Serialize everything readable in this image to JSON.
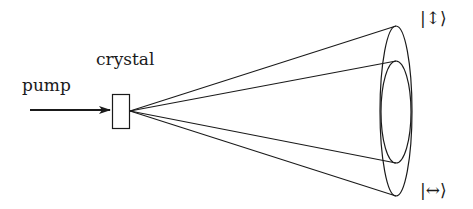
{
  "diagram": {
    "labels": {
      "pump": "pump",
      "crystal": "crystal",
      "state_vertical": "|↕⟩",
      "state_horizontal": "|↔⟩"
    },
    "colors": {
      "stroke": "#1a1a1a",
      "background": "#ffffff"
    },
    "elements": {
      "pump_arrow": {
        "x1": 30,
        "y1": 110,
        "x2": 110,
        "y2": 110
      },
      "crystal_box": {
        "x": 112,
        "y": 94,
        "w": 17,
        "h": 34
      },
      "apex": {
        "x": 130,
        "y": 111
      },
      "outer_cone": {
        "cx": 396,
        "cy": 111,
        "rx": 16,
        "ry": 85
      },
      "inner_cone": {
        "cx": 396,
        "cy": 112,
        "rx": 15,
        "ry": 51
      }
    }
  }
}
